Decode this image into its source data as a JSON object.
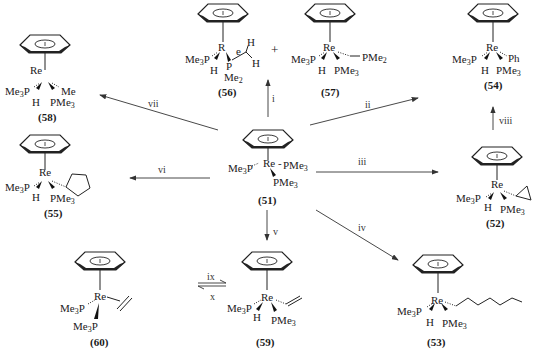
{
  "diagram": {
    "compounds": [
      {
        "id": "51",
        "label": "(51)",
        "metal": "Re",
        "ligands": [
          "Me3P",
          "PMe3",
          "PMe3"
        ]
      },
      {
        "id": "52",
        "label": "(52)",
        "metal": "Re",
        "ligands": [
          "Me3P",
          "H",
          "PMe3",
          "cyclopropyl"
        ]
      },
      {
        "id": "53",
        "label": "(53)",
        "metal": "Re",
        "ligands": [
          "Me3P",
          "H",
          "PMe3",
          "n-hexyl"
        ]
      },
      {
        "id": "54",
        "label": "(54)",
        "metal": "Re",
        "ligands": [
          "Me3P",
          "H",
          "PMe3",
          "Ph"
        ]
      },
      {
        "id": "55",
        "label": "(55)",
        "metal": "Re",
        "ligands": [
          "Me3P",
          "H",
          "PMe3",
          "cyclopentyl"
        ]
      },
      {
        "id": "56",
        "label": "(56)",
        "metal": "Re",
        "ligands": [
          "Me3P",
          "H",
          "P",
          "Me2",
          "H",
          "H"
        ]
      },
      {
        "id": "57",
        "label": "(57)",
        "metal": "Re",
        "ligands": [
          "Me3P",
          "H",
          "PMe3",
          "PMe2"
        ]
      },
      {
        "id": "58",
        "label": "(58)",
        "metal": "Re",
        "ligands": [
          "Me3P",
          "H",
          "PMe3",
          "Me"
        ]
      },
      {
        "id": "59",
        "label": "(59)",
        "metal": "Re",
        "ligands": [
          "Me3P",
          "H",
          "PMe3",
          "vinyl"
        ]
      },
      {
        "id": "60",
        "label": "(60)",
        "metal": "Re",
        "ligands": [
          "Me3P",
          "Me3P",
          "ethylene"
        ]
      }
    ],
    "arrows": [
      {
        "label": "i",
        "from": "51",
        "to": "56+57"
      },
      {
        "label": "ii",
        "from": "51",
        "to": "54"
      },
      {
        "label": "iii",
        "from": "51",
        "to": "52"
      },
      {
        "label": "iv",
        "from": "51",
        "to": "53"
      },
      {
        "label": "v",
        "from": "51",
        "to": "59"
      },
      {
        "label": "vi",
        "from": "51",
        "to": "55"
      },
      {
        "label": "vii",
        "from": "51",
        "to": "58"
      },
      {
        "label": "viii",
        "from": "52",
        "to": "54"
      },
      {
        "label": "ix",
        "from": "59",
        "to": "60"
      },
      {
        "label": "x",
        "from": "60",
        "to": "59"
      }
    ],
    "plus_sign": "+",
    "text": {
      "re": "Re",
      "r": "R",
      "e": "e",
      "me3p": "Me3P",
      "pme3": "PMe3",
      "pme2": "PMe2",
      "h": "H",
      "me": "Me",
      "ph": "Ph",
      "p": "P",
      "me2": "Me2"
    }
  }
}
